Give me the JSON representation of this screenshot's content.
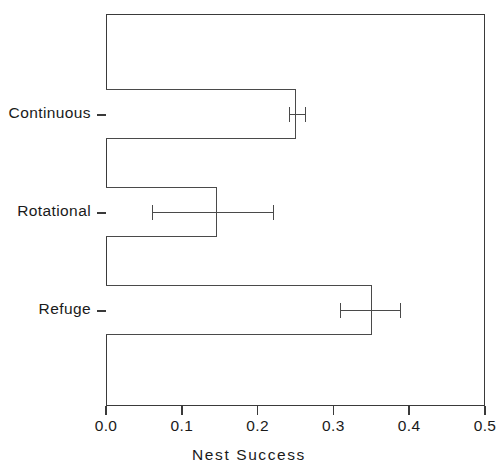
{
  "chart_data": {
    "type": "bar",
    "orientation": "horizontal",
    "title": "",
    "xlabel": "Nest Success",
    "ylabel": "",
    "categories": [
      "Continuous",
      "Rotational",
      "Refuge"
    ],
    "values": [
      0.25,
      0.147,
      0.351
    ],
    "error_low": [
      0.242,
      0.061,
      0.309
    ],
    "error_high": [
      0.264,
      0.221,
      0.389
    ],
    "xlim": [
      0.0,
      0.5
    ],
    "xticks": [
      0.0,
      0.1,
      0.2,
      0.3,
      0.4,
      0.5
    ],
    "xtick_labels": [
      "0.0",
      "0.1",
      "0.2",
      "0.3",
      "0.4",
      "0.5"
    ],
    "grid": false,
    "legend": null,
    "bar_fill_color": "#ffffff",
    "bar_edge_color": "#4a4a4a",
    "axis_color": "#3a3a3a",
    "series": [
      {
        "name": "Nest Success",
        "points": [
          {
            "category": "Continuous",
            "value": 0.25,
            "err_low": 0.242,
            "err_high": 0.264
          },
          {
            "category": "Rotational",
            "value": 0.147,
            "err_low": 0.061,
            "err_high": 0.221
          },
          {
            "category": "Refuge",
            "value": 0.351,
            "err_low": 0.309,
            "err_high": 0.389
          }
        ]
      }
    ]
  }
}
